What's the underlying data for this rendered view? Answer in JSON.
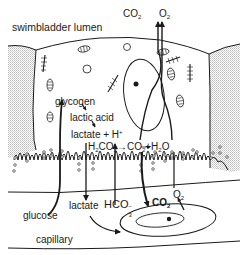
{
  "diagram": {
    "colors": {
      "ink": "#1a1a1a",
      "hatch": "#bdbdbd",
      "background": "#ffffff"
    },
    "regions": {
      "top": "swimbladder lumen",
      "bottom": "capillary"
    },
    "labels": {
      "swimbladder_lumen": "swimbladder lumen",
      "co2_top": "CO",
      "co2_top_sub": "2",
      "o2_top": "O",
      "o2_top_sub": "2",
      "glycogen": "glycogen",
      "lactic_acid": "lactic acid",
      "lactate_h": "lactate + H",
      "lactate_h_sup": "+",
      "h2co3_a": "H",
      "h2co3_sub1": "2",
      "h2co3_b": "CO",
      "h2co3_sub2": "3",
      "arrow_sym": "→",
      "co2_h2o_a": "CO",
      "co2_h2o_sub1": "2",
      "co2_h2o_b": "+H",
      "co2_h2o_sub2": "2",
      "co2_h2o_c": "O",
      "glucose": "glucose",
      "lactate": "lactate",
      "hco3": "HCO",
      "hco3_sub": "3",
      "hco3_sup": "−",
      "co2_cap": "CO",
      "co2_cap_sub": "2",
      "o2_cap": "O",
      "o2_cap_sub": "2",
      "capillary": "capillary"
    },
    "flows": [
      {
        "from": "capillary",
        "to": "cell",
        "substance": "glucose"
      },
      {
        "from": "glucose",
        "to": "glycogen"
      },
      {
        "from": "glycogen",
        "to": "lactic acid"
      },
      {
        "from": "lactic acid",
        "to": "lactate + H+"
      },
      {
        "from": "cell",
        "to": "capillary",
        "substance": "lactate"
      },
      {
        "from": "capillary",
        "to": "cell",
        "substance": "HCO3-"
      },
      {
        "from": "H2CO3",
        "to": "CO2 + H2O"
      },
      {
        "from": "cell",
        "to": "swimbladder lumen",
        "substance": "CO2"
      },
      {
        "from": "cell",
        "to": "swimbladder lumen",
        "substance": "O2"
      },
      {
        "from": "cell",
        "to": "capillary",
        "substance": "CO2"
      },
      {
        "from": "red blood cell",
        "to": "cell",
        "substance": "O2"
      }
    ]
  }
}
